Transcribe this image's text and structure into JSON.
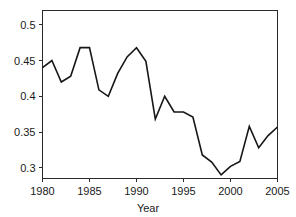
{
  "chart_data": {
    "type": "line",
    "title": "",
    "subtitle": "",
    "xlabel": "Year",
    "ylabel": "",
    "grid": false,
    "legend": false,
    "legend_position": "none",
    "xlim": [
      1980,
      2005
    ],
    "ylim": [
      0.285,
      0.52
    ],
    "xticks": [
      1980,
      1985,
      1990,
      1995,
      2000,
      2005
    ],
    "xtick_labels": [
      "1980",
      "1985",
      "1990",
      "1995",
      "2000",
      "2005"
    ],
    "yticks": [
      0.3,
      0.35,
      0.4,
      0.45,
      0.5
    ],
    "ytick_labels": [
      "0.3",
      "0.35",
      "0.4",
      "0.45",
      "0.5"
    ],
    "line_color": "#161616",
    "x": [
      1980,
      1981,
      1982,
      1983,
      1984,
      1985,
      1986,
      1987,
      1988,
      1989,
      1990,
      1991,
      1992,
      1993,
      1994,
      1995,
      1996,
      1997,
      1998,
      1999,
      2000,
      2001,
      2002,
      2003,
      2004,
      2005
    ],
    "series": [
      {
        "name": "value",
        "values": [
          0.44,
          0.45,
          0.42,
          0.428,
          0.468,
          0.468,
          0.409,
          0.4,
          0.432,
          0.455,
          0.468,
          0.449,
          0.368,
          0.4,
          0.378,
          0.378,
          0.371,
          0.318,
          0.308,
          0.29,
          0.302,
          0.309,
          0.358,
          0.328,
          0.345,
          0.357
        ]
      }
    ]
  },
  "axis": {
    "x_title": "Year"
  }
}
